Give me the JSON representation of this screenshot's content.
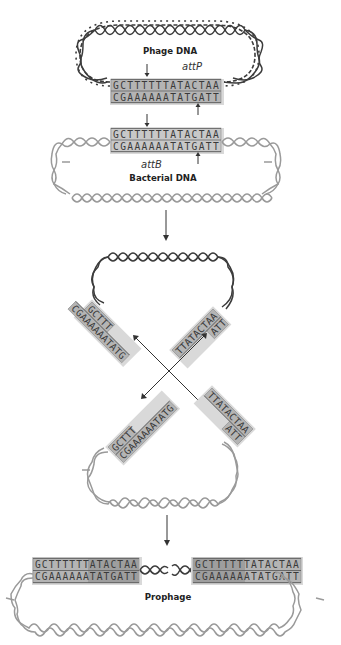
{
  "figure": {
    "panel_1": {
      "phage_label": "Phage DNA",
      "phage_site_label": "attP",
      "phage_top_strand": "GCTTTTTTATACTAA",
      "phage_bottom_strand": "CGAAAAAATATGATT",
      "bacterial_top_strand": "GCTTTTTTATACTAA",
      "bacterial_bottom_strand": "CGAAAAAATATGATT",
      "bacterial_site_label": "attB",
      "bacterial_label": "Bacterial DNA"
    },
    "panel_2": {
      "upper_left_top": "GCTTT",
      "upper_left_bottom": "CGAAAAAATATG",
      "upper_right_top": "TTATACTAA",
      "upper_right_bottom": "ATT",
      "lower_left_top": "GCTTT",
      "lower_left_bottom": "CGAAAAAATATG",
      "lower_right_top": "TTATACTAA",
      "lower_right_bottom": "ATT"
    },
    "panel_3": {
      "left_top_strand": "GCTTTTTTATACTAA",
      "left_bottom_strand": "CGAAAAAATATGATT",
      "right_top_strand": "GCTTTTTTATACTAA",
      "right_bottom_strand": "CGAAAAAATATGATT",
      "prophage_label": "Prophage"
    },
    "colors": {
      "phage_helix": "#3c3c3c",
      "bacterial_helix": "#9a9a9a",
      "sequence_box": "#b4b4b4",
      "background": "#ffffff"
    }
  }
}
